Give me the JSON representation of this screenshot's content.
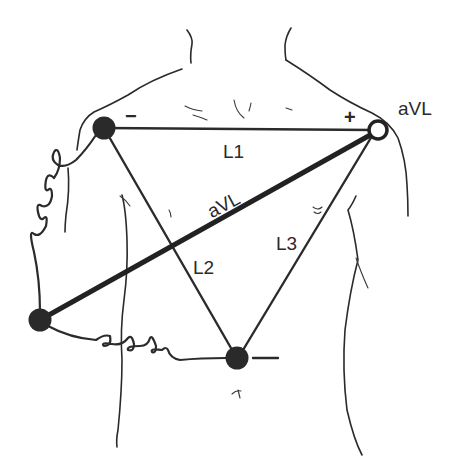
{
  "diagram": {
    "type": "ECG limb lead placement (Einthoven triangle with augmented lead aVL)",
    "electrodes": [
      {
        "id": "right-arm",
        "position": "right shoulder (viewer's left)",
        "style": "filled",
        "polarity": "-"
      },
      {
        "id": "left-arm",
        "position": "left shoulder (viewer's right)",
        "style": "open",
        "label": "aVL",
        "polarity": "+"
      },
      {
        "id": "right-leg",
        "position": "lower left of torso",
        "style": "filled"
      },
      {
        "id": "left-leg",
        "position": "lower center of torso",
        "style": "filled",
        "polarity": "-"
      }
    ],
    "leads": [
      {
        "name": "L1",
        "from": "right-arm",
        "to": "left-arm"
      },
      {
        "name": "L2",
        "from": "right-arm",
        "to": "left-leg"
      },
      {
        "name": "L3",
        "from": "left-arm",
        "to": "left-leg"
      },
      {
        "name": "aVL",
        "from": "right-leg",
        "to": "left-arm",
        "emphasis": "bold"
      }
    ],
    "labels": {
      "minus_top": "−",
      "plus_top": "+",
      "aVL_outside": "aVL",
      "aVL_line": "aVL",
      "L1": "L1",
      "L2": "L2",
      "L3": "L3",
      "minus_bottom": "−"
    },
    "colors": {
      "ink": "#2a2a2a",
      "background": "#ffffff"
    }
  }
}
